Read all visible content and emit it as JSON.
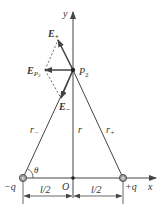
{
  "diagram": {
    "labels": {
      "y_axis": "y",
      "x_axis": "x",
      "origin": "O",
      "point": "P",
      "point_sub": "2",
      "e_plus": "E",
      "e_plus_sub": "+",
      "e_minus": "E",
      "e_minus_sub": "−",
      "e_p": "E",
      "e_p_sub": "P",
      "e_p_subsub": "2",
      "r_minus": "r",
      "r_minus_sub": "−",
      "r_plus": "r",
      "r_plus_sub": "+",
      "r": "r",
      "theta": "θ",
      "neg_charge": "−q",
      "pos_charge": "+q",
      "half_l_left": "l/2",
      "half_l_right": "l/2"
    },
    "colors": {
      "line": "#444444",
      "charge_fill": "#9a9a9a",
      "charge_stroke": "#555555"
    }
  }
}
